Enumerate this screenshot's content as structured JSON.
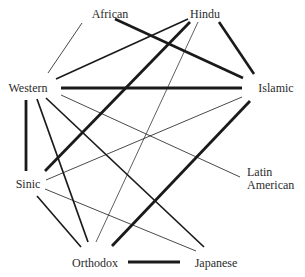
{
  "diagram": {
    "type": "network",
    "nodes": [
      {
        "id": "african",
        "label": "African",
        "x": 110,
        "y": 8,
        "align": "center"
      },
      {
        "id": "hindu",
        "label": "Hindu",
        "x": 205,
        "y": 8,
        "align": "center"
      },
      {
        "id": "western",
        "label": "Western",
        "x": 28,
        "y": 82,
        "align": "center"
      },
      {
        "id": "islamic",
        "label": "Islamic",
        "x": 276,
        "y": 82,
        "align": "center"
      },
      {
        "id": "latin_american",
        "label_line1": "Latin",
        "label_line2": "American",
        "x": 247,
        "y": 166,
        "align": "left"
      },
      {
        "id": "sinic",
        "label": "Sinic",
        "x": 28,
        "y": 178,
        "align": "center"
      },
      {
        "id": "orthodox",
        "label": "Orthodox",
        "x": 95,
        "y": 257,
        "align": "center"
      },
      {
        "id": "japanese",
        "label": "Japanese",
        "x": 216,
        "y": 257,
        "align": "center"
      }
    ],
    "edge_colors": {
      "stroke": "#1a1a1a"
    },
    "edges": [
      {
        "from": "african",
        "to": "western",
        "weight": "thin",
        "x1": 82,
        "y1": 23,
        "x2": 48,
        "y2": 73,
        "w": 0.8
      },
      {
        "from": "african",
        "to": "islamic",
        "weight": "thick",
        "x1": 115,
        "y1": 19,
        "x2": 243,
        "y2": 78,
        "w": 2.6
      },
      {
        "from": "hindu",
        "to": "western",
        "weight": "medium",
        "x1": 188,
        "y1": 19,
        "x2": 56,
        "y2": 79,
        "w": 1.6
      },
      {
        "from": "hindu",
        "to": "sinic",
        "weight": "thick",
        "x1": 190,
        "y1": 22,
        "x2": 45,
        "y2": 171,
        "w": 2.8
      },
      {
        "from": "hindu",
        "to": "orthodox",
        "weight": "thin",
        "x1": 198,
        "y1": 22,
        "x2": 96,
        "y2": 242,
        "w": 0.7
      },
      {
        "from": "hindu",
        "to": "islamic",
        "weight": "thick",
        "x1": 219,
        "y1": 22,
        "x2": 254,
        "y2": 74,
        "w": 2.6
      },
      {
        "from": "western",
        "to": "islamic",
        "weight": "thick",
        "x1": 61,
        "y1": 88,
        "x2": 242,
        "y2": 88,
        "w": 2.8
      },
      {
        "from": "western",
        "to": "sinic",
        "weight": "thick",
        "x1": 26,
        "y1": 100,
        "x2": 26,
        "y2": 171,
        "w": 2.8
      },
      {
        "from": "western",
        "to": "orthodox",
        "weight": "medium",
        "x1": 37,
        "y1": 99,
        "x2": 88,
        "y2": 242,
        "w": 1.7
      },
      {
        "from": "western",
        "to": "japanese",
        "weight": "medium",
        "x1": 46,
        "y1": 98,
        "x2": 204,
        "y2": 247,
        "w": 1.7
      },
      {
        "from": "western",
        "to": "latin_american",
        "weight": "thin",
        "x1": 61,
        "y1": 95,
        "x2": 240,
        "y2": 177,
        "w": 0.8
      },
      {
        "from": "islamic",
        "to": "sinic",
        "weight": "thin",
        "x1": 242,
        "y1": 97,
        "x2": 46,
        "y2": 180,
        "w": 0.8
      },
      {
        "from": "islamic",
        "to": "orthodox",
        "weight": "thick",
        "x1": 250,
        "y1": 101,
        "x2": 112,
        "y2": 246,
        "w": 2.8
      },
      {
        "from": "sinic",
        "to": "orthodox",
        "weight": "medium",
        "x1": 37,
        "y1": 196,
        "x2": 81,
        "y2": 247,
        "w": 1.6
      },
      {
        "from": "sinic",
        "to": "japanese",
        "weight": "thin",
        "x1": 45,
        "y1": 189,
        "x2": 196,
        "y2": 251,
        "w": 0.8
      },
      {
        "from": "orthodox",
        "to": "japanese",
        "weight": "thick",
        "x1": 128,
        "y1": 262,
        "x2": 180,
        "y2": 262,
        "w": 2.8
      }
    ]
  }
}
